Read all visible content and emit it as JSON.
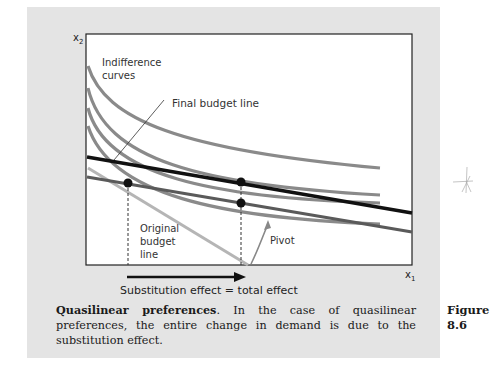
{
  "figure": {
    "number_label": "Figure",
    "number": "8.6",
    "caption_title": "Quasilinear preferences",
    "caption_body": ". In the case of quasilinear preferences, the entire change in demand is due to the substitution effect.",
    "panel_color": "#e4e4e4"
  },
  "diagram": {
    "axis_x_label": "x1",
    "axis_y_label": "x2",
    "labels": {
      "indifference_1": "Indifference",
      "indifference_2": "curves",
      "final_budget": "Final budget line",
      "original_1": "Original",
      "original_2": "budget",
      "original_3": "line",
      "pivot": "Pivot",
      "effect": "Substitution effect = total effect"
    },
    "colors": {
      "indifference": "#8a8a8a",
      "final_budget": "#111111",
      "original_budget": "#5a5a5a",
      "steep_budget": "#b5b5b5",
      "dot": "#111111"
    },
    "indifference_curves": [
      {
        "left_y": 72,
        "right_y": 168
      },
      {
        "left_y": 92,
        "right_y": 195
      },
      {
        "left_y": 110,
        "right_y": 203
      },
      {
        "left_y": 128,
        "right_y": 224
      }
    ],
    "points": [
      {
        "name": "original-optimum",
        "x": 128,
        "y": 183
      },
      {
        "name": "final-optimum",
        "x": 241,
        "y": 182
      },
      {
        "name": "compensated-optimum",
        "x": 241,
        "y": 203
      }
    ]
  }
}
